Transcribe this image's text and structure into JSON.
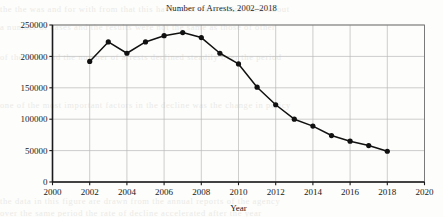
{
  "chart_data": {
    "type": "line",
    "title": "Number of Arrests, 2002–2018",
    "xlabel": "Year",
    "ylabel": "",
    "xlim": [
      2000,
      2020
    ],
    "ylim": [
      0,
      250000
    ],
    "grid": true,
    "legend": "none",
    "marker": "filled-circle",
    "line_color": "#111111",
    "marker_color": "#111111",
    "grid_color": "#b9b9b9",
    "x": [
      2002,
      2003,
      2004,
      2005,
      2006,
      2007,
      2008,
      2009,
      2010,
      2011,
      2012,
      2013,
      2014,
      2015,
      2016,
      2017,
      2018
    ],
    "values": [
      192000,
      223000,
      205000,
      223000,
      233000,
      238000,
      230000,
      205000,
      188000,
      151000,
      123000,
      100000,
      89000,
      74000,
      65000,
      58000,
      49000
    ],
    "xticks": [
      2000,
      2002,
      2004,
      2006,
      2008,
      2010,
      2012,
      2014,
      2016,
      2018,
      2020
    ],
    "xtick_labels": [
      "2000",
      "2002",
      "2004",
      "2006",
      "2008",
      "2010",
      "2012",
      "2014",
      "2016",
      "2018",
      "2020"
    ],
    "yticks": [
      0,
      50000,
      100000,
      150000,
      200000,
      250000
    ],
    "ytick_labels": [
      "0",
      "50000",
      "100000",
      "150000",
      "200000",
      "250000"
    ]
  },
  "background_text": {
    "line1": "the the was and for with from that this have been were which their about",
    "line2": "a number of cases and the results were not the same as those of other",
    "line3": "of the total and the number of arrests declined steadily over the period",
    "line4": "one of the most important factors in the decline was the change in policy",
    "line5": "the data in this figure are drawn from the annual reports of the agency",
    "line6": "over the same period the rate of decline accelerated after the year"
  }
}
